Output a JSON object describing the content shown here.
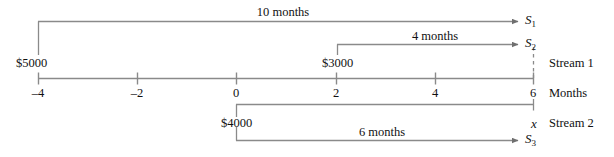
{
  "figure": {
    "type": "cash-flow-timeline-diagram",
    "axis": {
      "label": "Months",
      "tick_values": [
        "–4",
        "–2",
        "0",
        "2",
        "4",
        "6"
      ],
      "tick_positions_months": [
        -4,
        -2,
        0,
        2,
        4,
        6
      ],
      "range": [
        -4,
        6
      ]
    },
    "streams": [
      {
        "name": "Stream 1"
      },
      {
        "name": "Stream 2"
      }
    ],
    "cash_flows": [
      {
        "amount": "$5000",
        "at_month": -4,
        "stream": "Stream 1"
      },
      {
        "amount": "$3000",
        "at_month": 2,
        "stream": "Stream 1"
      },
      {
        "amount": "$4000",
        "at_month": 0,
        "stream": "Stream 2"
      }
    ],
    "spans": [
      {
        "label": "10 months",
        "from_month": -4,
        "to_month": 6,
        "result": "S",
        "result_sub": "1"
      },
      {
        "label": "4 months",
        "from_month": 2,
        "to_month": 6,
        "result": "S",
        "result_sub": "2"
      },
      {
        "label": "6 months",
        "from_month": 0,
        "to_month": 6,
        "result": "S",
        "result_sub": "3"
      }
    ],
    "unknown_value": {
      "symbol": "x",
      "at_month": 6,
      "stream": "Stream 2"
    },
    "colors": {
      "line": "#8a8a8a",
      "text": "#111111",
      "background": "#ffffff"
    }
  }
}
